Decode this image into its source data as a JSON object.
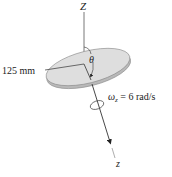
{
  "diagram": {
    "axis_top_label": "Z",
    "axis_bottom_label": "z",
    "radius_label": "125 mm",
    "angle_label": "θ",
    "omega_symbol": "ω",
    "omega_subscript": "z",
    "omega_value": " = 6 rad/s",
    "colors": {
      "disk_top": "#dcdcdc",
      "disk_edge": "#b5b5b5",
      "line": "#333333",
      "text": "#222222"
    }
  }
}
